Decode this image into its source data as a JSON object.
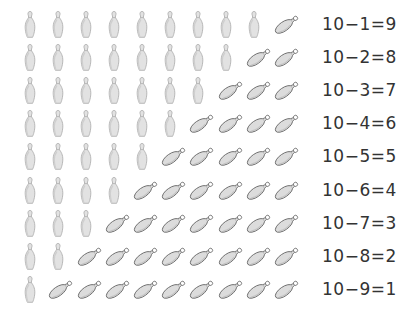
{
  "worksheet": {
    "total_pins": 10,
    "colors": {
      "pin_fill": "#e2e2e2",
      "pin_shade": "#cfcfcf",
      "pin_outline": "#a8a8a8",
      "fallen_fill": "#dcdcdc",
      "fallen_outline": "#6f6f6f",
      "text": "#333333"
    },
    "rows": [
      {
        "standing": 9,
        "fallen": 1,
        "equation": "10−1=9"
      },
      {
        "standing": 8,
        "fallen": 2,
        "equation": "10−2=8"
      },
      {
        "standing": 7,
        "fallen": 3,
        "equation": "10−3=7"
      },
      {
        "standing": 6,
        "fallen": 4,
        "equation": "10−4=6"
      },
      {
        "standing": 5,
        "fallen": 5,
        "equation": "10−5=5"
      },
      {
        "standing": 4,
        "fallen": 6,
        "equation": "10−6=4"
      },
      {
        "standing": 3,
        "fallen": 7,
        "equation": "10−7=3"
      },
      {
        "standing": 2,
        "fallen": 8,
        "equation": "10−8=2"
      },
      {
        "standing": 1,
        "fallen": 9,
        "equation": "10−9=1"
      }
    ]
  },
  "icons": {
    "standing": "standing-bowling-pin-icon",
    "fallen": "fallen-bowling-pin-icon"
  }
}
